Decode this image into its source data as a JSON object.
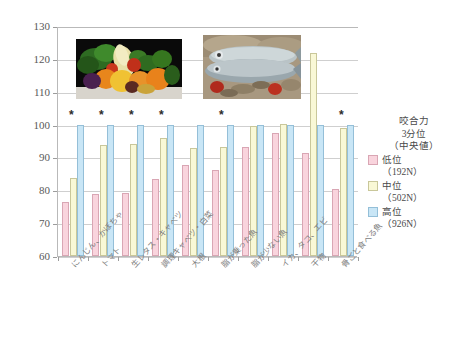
{
  "chart_data": {
    "type": "bar",
    "title": "",
    "xlabel": "",
    "ylabel": "",
    "ylim": [
      60,
      130
    ],
    "yticks": [
      60,
      70,
      80,
      90,
      100,
      110,
      120,
      130
    ],
    "grid": true,
    "legend_position": "right",
    "legend_title": "咬合力\n3分位\n（中央値）",
    "categories": [
      "にんじん、かぼちゃ",
      "トマト",
      "生レタス・キャベツ",
      "調理キャベツ・白菜",
      "大根",
      "脂が乗った魚",
      "脂が少ない魚",
      "イカ、タコ、エビ",
      "干物",
      "骨ごと食べる魚"
    ],
    "series": [
      {
        "name": "低位（192N）",
        "color": "#f9d4dd",
        "values": [
          76.5,
          79.0,
          79.1,
          83.4,
          87.6,
          86.1,
          93.3,
          97.3,
          91.5,
          80.5
        ]
      },
      {
        "name": "中位（502N）",
        "color": "#f9f8d6",
        "values": [
          83.7,
          93.9,
          94.0,
          96.0,
          92.8,
          93.3,
          99.6,
          100.2,
          121.8,
          99.0
        ]
      },
      {
        "name": "高位（926N）",
        "color": "#c9e6f6",
        "values": [
          100,
          100,
          100,
          100,
          100,
          100,
          100,
          100,
          100,
          100
        ]
      }
    ],
    "significance_markers": {
      "symbol": "*",
      "groups": [
        1,
        2,
        3,
        4,
        6,
        10
      ]
    }
  },
  "yaxis": {
    "labels": [
      "130",
      "120",
      "110",
      "100",
      "90",
      "80",
      "70",
      "60"
    ]
  },
  "xaxis": {
    "labels": [
      "にんじん、かぼちゃ",
      "トマト",
      "生レタス・キャベツ",
      "調理キャベツ・白菜",
      "大根",
      "脂が乗った魚",
      "脂が少ない魚",
      "イカ、タコ、エビ",
      "干物",
      "骨ごと食べる魚"
    ]
  },
  "legend": {
    "title_line1": "咬合力",
    "title_line2": "3分位",
    "title_line3": "（中央値）",
    "items": [
      {
        "label": "低位",
        "sub": "（192N）",
        "key": "low"
      },
      {
        "label": "中位",
        "sub": "（502N）",
        "key": "mid"
      },
      {
        "label": "高位",
        "sub": "（926N）",
        "key": "high"
      }
    ]
  },
  "photos": [
    {
      "name": "vegetables-photo",
      "alt": "野菜の写真"
    },
    {
      "name": "fish-photo",
      "alt": "魚の写真"
    }
  ]
}
